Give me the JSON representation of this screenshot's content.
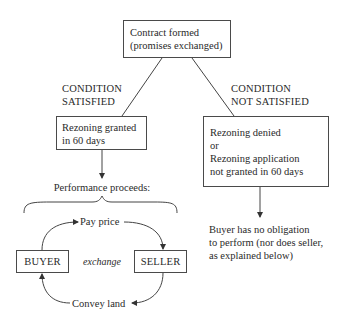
{
  "diagram": {
    "root": {
      "line1": "Contract formed",
      "line2": "(promises exchanged)"
    },
    "branch_left": {
      "label_line1": "CONDITION",
      "label_line2": "SATISFIED",
      "box_line1": "Rezoning granted",
      "box_line2": "in 60 days",
      "result": "Performance proceeds:"
    },
    "branch_right": {
      "label_line1": "CONDITION",
      "label_line2": "NOT SATISFIED",
      "box_line1": "Rezoning denied",
      "box_line2": "or",
      "box_line3": "Rezoning application",
      "box_line4": "not granted in 60 days",
      "result_line1": "Buyer has no obligation",
      "result_line2": "to perform (nor does seller,",
      "result_line3": "as explained below)"
    },
    "exchange": {
      "buyer": "BUYER",
      "seller": "SELLER",
      "middle": "exchange",
      "top_flow": "Pay price",
      "bottom_flow": "Convey land"
    }
  }
}
